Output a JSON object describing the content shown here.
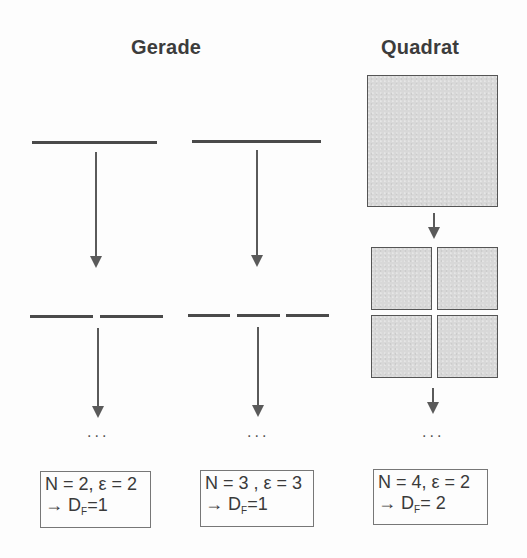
{
  "titles": {
    "line": "Gerade",
    "square": "Quadrat"
  },
  "columns": [
    {
      "name": "line-n2",
      "continuation": "...",
      "result_line1": "N = 2,  ε = 2",
      "result_arrow": "→",
      "result_symbol": "D",
      "result_subscript": "F",
      "result_value": "=1"
    },
    {
      "name": "line-n3",
      "continuation": "...",
      "result_line1": "N = 3 ,  ε = 3",
      "result_arrow": "→",
      "result_symbol": "D",
      "result_subscript": "F",
      "result_value": "=1"
    },
    {
      "name": "square-n4",
      "continuation": "...",
      "result_line1": "N = 4,  ε = 2",
      "result_arrow": "→",
      "result_symbol": "D",
      "result_subscript": "F",
      "result_value": "= 2"
    }
  ],
  "colors": {
    "stroke": "#4a4a4a",
    "fill": "#d8d8d8",
    "background": "#fdfdfd"
  }
}
